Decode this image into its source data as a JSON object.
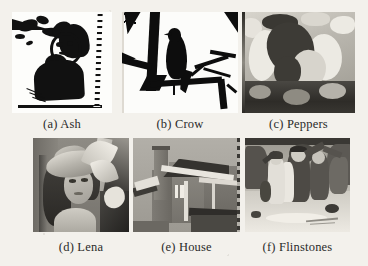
{
  "figure": {
    "layout": "2x3 grid of sub-figures",
    "background_color": "#f3f1ec",
    "panels": [
      {
        "id": "a",
        "tag": "(a)",
        "name": "Ash",
        "caption": "(a) Ash",
        "image_kind": "binary-black-and-white-portrait"
      },
      {
        "id": "b",
        "tag": "(b)",
        "name": "Crow",
        "caption": "(b) Crow",
        "image_kind": "binary-black-and-white-bird-silhouette"
      },
      {
        "id": "c",
        "tag": "(c)",
        "name": "Peppers",
        "caption": "(c) Peppers",
        "image_kind": "posterized-grayscale-peppers"
      },
      {
        "id": "d",
        "tag": "(d)",
        "name": "Lena",
        "caption": "(d) Lena",
        "image_kind": "grayscale-portrait"
      },
      {
        "id": "e",
        "tag": "(e)",
        "name": "House",
        "caption": "(e) House",
        "image_kind": "grayscale-building-photo"
      },
      {
        "id": "f",
        "tag": "(f)",
        "name": "Flinstones",
        "caption": "(f) Flinstones",
        "image_kind": "grayscale-cartoon-frame"
      }
    ]
  }
}
